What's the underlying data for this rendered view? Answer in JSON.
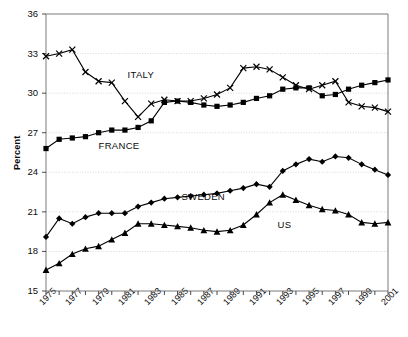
{
  "chart_data": {
    "type": "line",
    "title": "",
    "xlabel": "",
    "ylabel": "Percent",
    "grid": true,
    "legend_position": "inline-labels",
    "xlim": [
      1975,
      2001
    ],
    "ylim": [
      15,
      36
    ],
    "yticks": [
      15,
      18,
      21,
      24,
      27,
      30,
      33,
      36
    ],
    "xticks": [
      1975,
      1977,
      1979,
      1981,
      1983,
      1985,
      1987,
      1989,
      1991,
      1993,
      1995,
      1997,
      1999,
      2001
    ],
    "xtick_labels": [
      "1975",
      "1977",
      "1979",
      "1981",
      "1983",
      "1985",
      "1987",
      "1989",
      "1991",
      "1993",
      "1995",
      "1997",
      "1999",
      "2001"
    ],
    "ytick_labels": [
      "15",
      "18",
      "21",
      "24",
      "27",
      "30",
      "33",
      "36"
    ],
    "x": [
      1975,
      1976,
      1977,
      1978,
      1979,
      1980,
      1981,
      1982,
      1983,
      1984,
      1985,
      1986,
      1987,
      1988,
      1989,
      1990,
      1991,
      1992,
      1993,
      1994,
      1995,
      1996,
      1997,
      1998,
      1999,
      2000,
      2001
    ],
    "series": [
      {
        "name": "ITALY",
        "marker": "x",
        "label_x": 1981.2,
        "label_y": 31.4,
        "values": [
          32.8,
          33.0,
          33.3,
          31.6,
          30.9,
          30.8,
          29.4,
          28.2,
          29.2,
          29.5,
          29.4,
          29.4,
          29.6,
          29.9,
          30.4,
          31.9,
          32.0,
          31.8,
          31.2,
          30.6,
          30.3,
          30.6,
          30.9,
          29.3,
          29.0,
          28.9,
          28.6
        ]
      },
      {
        "name": "FRANCE",
        "marker": "square",
        "label_x": 1979.0,
        "label_y": 26.0,
        "values": [
          25.8,
          26.5,
          26.6,
          26.7,
          27.0,
          27.2,
          27.2,
          27.4,
          27.9,
          29.3,
          29.4,
          29.3,
          29.1,
          29.0,
          29.1,
          29.3,
          29.6,
          29.8,
          30.3,
          30.4,
          30.4,
          29.8,
          29.9,
          30.3,
          30.6,
          30.8,
          31.0
        ]
      },
      {
        "name": "SWEDEN",
        "marker": "diamond",
        "label_x": 1985.3,
        "label_y": 22.1,
        "values": [
          19.1,
          20.5,
          20.1,
          20.6,
          20.9,
          20.9,
          20.9,
          21.4,
          21.7,
          22.0,
          22.1,
          22.2,
          22.3,
          22.4,
          22.6,
          22.8,
          23.1,
          22.9,
          24.1,
          24.6,
          25.0,
          24.8,
          25.2,
          25.1,
          24.6,
          24.2,
          23.8
        ]
      },
      {
        "name": "US",
        "marker": "triangle",
        "label_x": 1992.6,
        "label_y": 20.0,
        "values": [
          16.6,
          17.1,
          17.8,
          18.2,
          18.4,
          18.9,
          19.4,
          20.1,
          20.1,
          20.0,
          19.9,
          19.8,
          19.6,
          19.5,
          19.6,
          20.0,
          20.8,
          21.7,
          22.3,
          21.9,
          21.5,
          21.2,
          21.1,
          20.8,
          20.2,
          20.1,
          20.2
        ]
      }
    ]
  }
}
